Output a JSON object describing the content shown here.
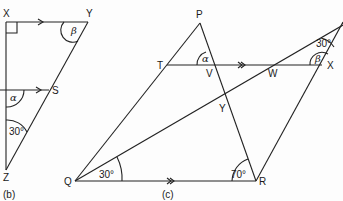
{
  "figure_b": {
    "caption": "(b)",
    "points": {
      "X": "X",
      "Y": "Y",
      "Z": "Z",
      "S": "S"
    },
    "angles": {
      "alpha": "α",
      "beta": "β",
      "angle_z": "30°"
    }
  },
  "figure_c": {
    "caption": "(c)",
    "points": {
      "P": "P",
      "T": "T",
      "V": "V",
      "W": "W",
      "X": "X",
      "Y": "Y",
      "Q": "Q",
      "R": "R"
    },
    "angles": {
      "alpha": "α",
      "beta": "β",
      "top_right": "30°",
      "angle_q": "30°",
      "angle_r": "70°"
    }
  }
}
